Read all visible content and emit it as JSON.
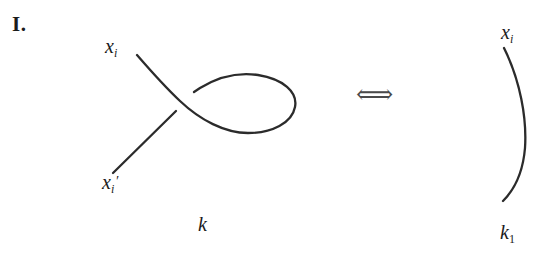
{
  "figure": {
    "move_label": "I.",
    "equivalence_symbol": "⟺",
    "stroke_color": "#2b2b2b",
    "background_color": "#ffffff",
    "text_color": "#1b1b1b"
  },
  "left_diagram": {
    "knot_label": "k",
    "endpoint_top_label": {
      "base": "x",
      "subscript": "i",
      "prime": ""
    },
    "endpoint_bottom_label": {
      "base": "x",
      "subscript": "i",
      "prime": "′"
    },
    "description": "strand with a kink (curl) forming one crossing"
  },
  "right_diagram": {
    "knot_label": "k",
    "knot_label_subscript": "1",
    "endpoint_top_label": {
      "base": "x",
      "subscript": "i",
      "prime": ""
    },
    "description": "simple arc with no crossing"
  }
}
